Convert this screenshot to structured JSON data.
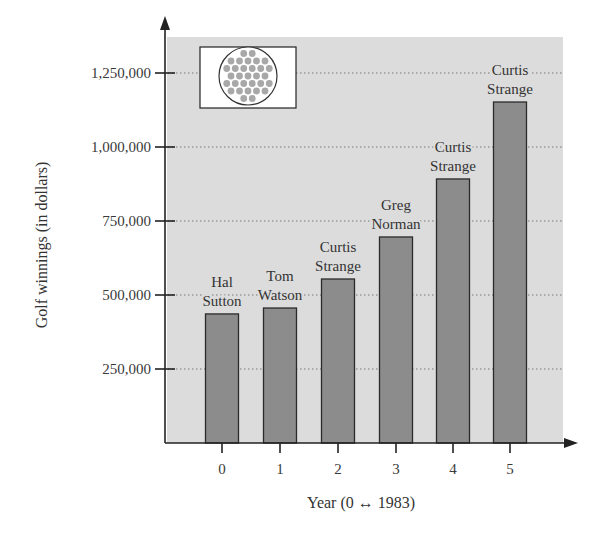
{
  "chart_data": {
    "type": "bar",
    "title": "",
    "xlabel": "Year (0 ↔ 1983)",
    "ylabel": "Golf winnings (in dollars)",
    "categories": [
      "0",
      "1",
      "2",
      "3",
      "4",
      "5"
    ],
    "values": [
      436000,
      456000,
      554000,
      696000,
      892000,
      1152000
    ],
    "bar_labels": [
      [
        "Hal",
        "Sutton"
      ],
      [
        "Tom",
        "Watson"
      ],
      [
        "Curtis",
        "Strange"
      ],
      [
        "Greg",
        "Norman"
      ],
      [
        "Curtis",
        "Strange"
      ],
      [
        "Curtis",
        "Strange"
      ]
    ],
    "yticks": [
      250000,
      500000,
      750000,
      1000000,
      1250000
    ],
    "ytick_labels": [
      "250,000",
      "500,000",
      "750,000",
      "1,000,000",
      "1,250,000"
    ],
    "ylim": [
      0,
      1370000
    ],
    "grid": "horizontal dotted",
    "legend": "none",
    "decoration": "golf-ball-icon"
  },
  "colors": {
    "plot_background": "#dcdcdc",
    "bar_fill": "#8c8c8c",
    "bar_stroke": "#2a2a2a",
    "axis": "#222222",
    "grid": "#777777",
    "ball_dimple": "#a8a8a8"
  }
}
